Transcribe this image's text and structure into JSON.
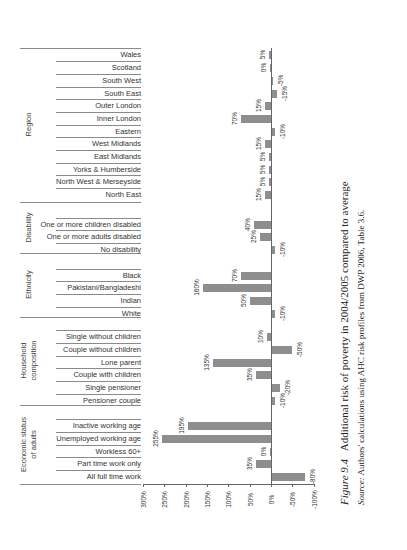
{
  "chart_data": {
    "type": "bar",
    "orientation": "horizontal (page rotated 90°)",
    "source": "Source: Authors' calculations using AHC risk profiles from DWP 2006, Table 3.6.",
    "xlabel": "",
    "ylabel": "",
    "xlim": [
      300,
      -100
    ],
    "x_ticks": [
      "300%",
      "250%",
      "200%",
      "150%",
      "100%",
      "50%",
      "0%",
      "-50%",
      "-100%"
    ],
    "groups": [
      {
        "name": "Region",
        "categories": [
          "Wales",
          "Scotland",
          "South West",
          "South East",
          "Outer London",
          "Inner London",
          "Eastern",
          "West Midlands",
          "East Midlands",
          "Yorks & Humberside",
          "North West & Merseyside",
          "North East"
        ],
        "values": [
          5,
          0,
          -5,
          -15,
          15,
          70,
          -10,
          15,
          5,
          5,
          5,
          15
        ],
        "labels": [
          "5%",
          "0%",
          "-5%",
          "-15%",
          "15%",
          "70%",
          "-10%",
          "15%",
          "5%",
          "5%",
          "5%",
          "15%"
        ]
      },
      {
        "name": "Disability",
        "categories": [
          "One or more children disabled",
          "One or more adults disabled",
          "No disability"
        ],
        "values": [
          40,
          25,
          -10
        ],
        "labels": [
          "40%",
          "25%",
          "-10%"
        ]
      },
      {
        "name": "Ethnicity",
        "categories": [
          "Black",
          "Pakistani/Bangladeshi",
          "Indian",
          "White"
        ],
        "values": [
          70,
          160,
          50,
          -10
        ],
        "labels": [
          "70%",
          "160%",
          "50%",
          "-10%"
        ]
      },
      {
        "name": "Household composition",
        "categories": [
          "Single without children",
          "Couple without children",
          "Lone parent",
          "Couple with children",
          "Single pensioner",
          "Pensioner couple"
        ],
        "values": [
          10,
          -50,
          135,
          35,
          -20,
          -10
        ],
        "labels": [
          "10%",
          "-50%",
          "135%",
          "35%",
          "-20%",
          "-10%"
        ]
      },
      {
        "name": "Economic status of adults",
        "categories": [
          "Inactive working age",
          "Unemployed working age",
          "Workless 60+",
          "Part time work only",
          "All full time work"
        ],
        "values": [
          195,
          255,
          0,
          35,
          -80
        ],
        "labels": [
          "195%",
          "255%",
          "0%",
          "35%",
          "-80%"
        ]
      }
    ],
    "grid": false,
    "legend": null
  },
  "caption": {
    "figure_label": "Figure 9.4",
    "title_text": "Additional risk of poverty in 2004/2005 compared to average",
    "source_label": "Source:",
    "source_text": "Authors' calculations using AHC risk profiles from DWP 2006, Table 3.6."
  },
  "group_labels": {
    "region": "Region",
    "disability": "Disability",
    "ethnicity": "Ethnicity",
    "household_1": "Household",
    "household_2": "composition",
    "economic_1": "Economic status",
    "economic_2": "of adults"
  },
  "colors": {
    "bar": "#8e8e8e",
    "axis": "#666666",
    "rule": "#8a8a8a"
  }
}
